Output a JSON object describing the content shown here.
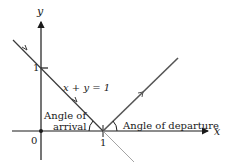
{
  "diagram": {
    "axes": {
      "x_label": "x",
      "y_label": "y",
      "origin_label": "0",
      "x_tick_label": "1",
      "y_tick_label": "1"
    },
    "line_label": "x + y = 1",
    "arrival_label_line1": "Angle of",
    "arrival_label_line2": "arrival",
    "departure_label": "Angle of departure",
    "colors": {
      "axis": "#1a1a1a",
      "incident_line": "#3a3a3a",
      "reflected_ray": "#555555",
      "extension_line": "#9a9a9a"
    }
  }
}
